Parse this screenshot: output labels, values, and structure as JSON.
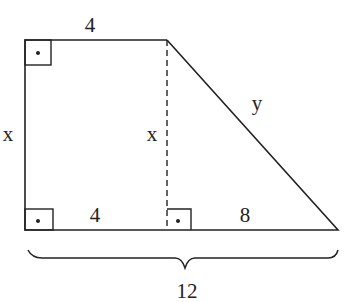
{
  "diagram": {
    "type": "right trapezoid",
    "labels": {
      "top": "4",
      "left": "x",
      "height_dashed": "x",
      "slant": "y",
      "bottom_left_segment": "4",
      "bottom_right_segment": "8",
      "bottom_total": "12"
    },
    "right_angle_markers": [
      "top-left",
      "bottom-left",
      "foot-of-height"
    ],
    "colors": {
      "stroke": "#222222",
      "background": "#ffffff"
    }
  }
}
